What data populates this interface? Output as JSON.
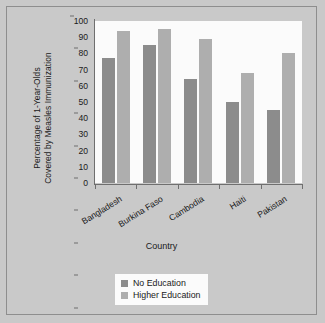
{
  "chart_data": {
    "type": "bar",
    "title": "",
    "xlabel": "Country",
    "ylabel": "Percentage of 1-Year-Olds Covered by Measles Immunization",
    "ylabel_lines": [
      "Percentage of 1-Year-Olds",
      "Covered by Measles Immunization"
    ],
    "categories": [
      "Bangladesh",
      "Burkina Faso",
      "Cambodia",
      "Haiti",
      "Pakistan"
    ],
    "series": [
      {
        "name": "No Education",
        "color": "#8c8c8c",
        "values": [
          77,
          85,
          64,
          50,
          45
        ]
      },
      {
        "name": "Higher Education",
        "color": "#aeaeae",
        "values": [
          94,
          95,
          89,
          68,
          80
        ]
      }
    ],
    "ylim": [
      0,
      100
    ],
    "yticks": [
      0,
      10,
      20,
      30,
      40,
      50,
      60,
      70,
      80,
      90,
      100
    ],
    "grid": false,
    "legend_position": "bottom-center"
  },
  "figure": {
    "background_color": "#c9c9c9",
    "plot_background_color": "#fbfbfb",
    "axis_color": "#6f6f6f"
  }
}
